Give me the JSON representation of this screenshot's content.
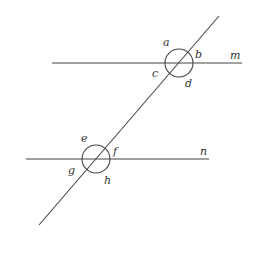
{
  "diagram": {
    "type": "parallel-lines-cut-by-transversal",
    "colors": {
      "line": "#444444",
      "label": "#333333",
      "background": "#ffffff"
    },
    "lines": {
      "m": {
        "label": "m",
        "x1": 52,
        "y1": 63,
        "x2": 242,
        "y2": 63
      },
      "n": {
        "label": "n",
        "x1": 26,
        "y1": 159,
        "x2": 209,
        "y2": 159
      },
      "transversal": {
        "x1": 219,
        "y1": 16,
        "x2": 39,
        "y2": 225
      }
    },
    "intersections": [
      {
        "name": "upper",
        "cx": 179,
        "cy": 63,
        "r": 14
      },
      {
        "name": "lower",
        "cx": 96,
        "cy": 159,
        "r": 14
      }
    ],
    "angle_labels": {
      "a": "a",
      "b": "b",
      "c": "c",
      "d": "d",
      "e": "e",
      "f": "f",
      "g": "g",
      "h": "h"
    },
    "line_labels": {
      "m": "m",
      "n": "n"
    }
  }
}
